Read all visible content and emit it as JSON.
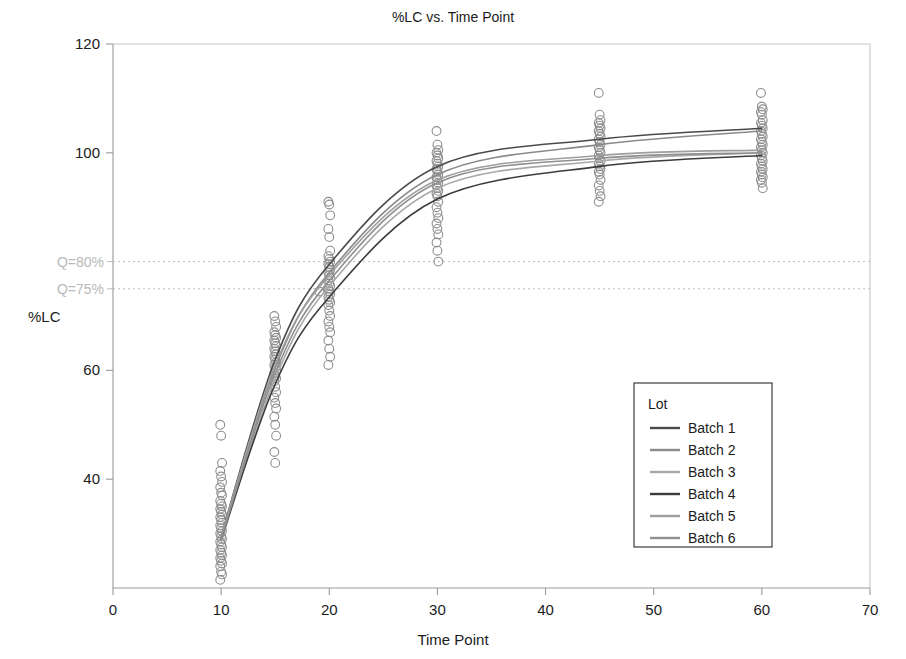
{
  "chart_data": {
    "type": "scatter",
    "title": "%LC vs. Time Point",
    "xlabel": "Time Point",
    "ylabel": "%LC",
    "xlim": [
      0,
      70
    ],
    "ylim": [
      20,
      120
    ],
    "grid": false,
    "xticks": [
      0,
      10,
      20,
      30,
      40,
      50,
      60,
      70
    ],
    "xtick_labels": [
      "0",
      "10",
      "20",
      "30",
      "40",
      "50",
      "60",
      "70"
    ],
    "yticks": [
      40,
      60,
      100,
      120
    ],
    "ytick_labels": [
      "40",
      "60",
      "100",
      "120"
    ],
    "legend": {
      "title": "Lot",
      "position": "right-lower",
      "entries": [
        {
          "label": "Batch 1",
          "color": "#4a4a4a"
        },
        {
          "label": "Batch 2",
          "color": "#8a8a8a"
        },
        {
          "label": "Batch 3",
          "color": "#a8a8a8"
        },
        {
          "label": "Batch 4",
          "color": "#3c3c3c"
        },
        {
          "label": "Batch 5",
          "color": "#9e9e9e"
        },
        {
          "label": "Batch 6",
          "color": "#8f8f8f"
        }
      ]
    },
    "reference_lines": [
      {
        "label": "Q=80%",
        "value": 80,
        "style": "dotted",
        "color": "#bdbdbd"
      },
      {
        "label": "Q=75%",
        "value": 75,
        "style": "dotted",
        "color": "#bdbdbd"
      }
    ],
    "x": [
      10,
      15,
      20,
      30,
      45,
      60
    ],
    "series": [
      {
        "name": "Batch 1",
        "color": "#4a4a4a",
        "curve_values": [
          29.5,
          62.0,
          79.5,
          97.5,
          102.5,
          104.5
        ]
      },
      {
        "name": "Batch 2",
        "color": "#8a8a8a",
        "curve_values": [
          29.0,
          60.5,
          78.0,
          96.0,
          101.5,
          104.0
        ]
      },
      {
        "name": "Batch 3",
        "color": "#a8a8a8",
        "curve_values": [
          28.5,
          58.5,
          75.5,
          93.5,
          98.5,
          100.0
        ]
      },
      {
        "name": "Batch 4",
        "color": "#3c3c3c",
        "curve_values": [
          29.0,
          57.5,
          73.5,
          91.5,
          97.5,
          99.5
        ]
      },
      {
        "name": "Batch 5",
        "color": "#9e9e9e",
        "curve_values": [
          29.5,
          61.0,
          77.5,
          95.0,
          99.5,
          100.5
        ]
      },
      {
        "name": "Batch 6",
        "color": "#8f8f8f",
        "curve_values": [
          29.0,
          59.5,
          76.5,
          94.5,
          99.0,
          100.0
        ]
      }
    ],
    "scatter_clusters": [
      {
        "x": 10,
        "marker": "open-circle",
        "color": "#8e8e8e",
        "n": 37,
        "range": [
          21.5,
          50.0
        ],
        "values": [
          50.0,
          48.0,
          43.0,
          41.5,
          40.5,
          39.5,
          38.5,
          37.5,
          37.0,
          36.0,
          35.5,
          35.0,
          34.5,
          34.0,
          33.5,
          33.0,
          32.5,
          32.0,
          31.5,
          31.0,
          30.5,
          30.0,
          29.5,
          29.0,
          28.5,
          28.0,
          27.5,
          27.0,
          26.5,
          26.0,
          25.5,
          25.0,
          24.5,
          24.0,
          23.0,
          22.5,
          21.5
        ]
      },
      {
        "x": 15,
        "marker": "open-circle",
        "color": "#8e8e8e",
        "n": 32,
        "range": [
          43.0,
          70.0
        ],
        "values": [
          70.0,
          69.0,
          68.0,
          67.0,
          66.5,
          66.0,
          65.5,
          65.0,
          64.5,
          64.0,
          63.5,
          63.0,
          62.5,
          62.0,
          61.5,
          61.0,
          60.5,
          60.0,
          59.5,
          59.0,
          58.5,
          58.0,
          57.0,
          56.0,
          55.0,
          54.0,
          53.0,
          51.5,
          50.0,
          48.0,
          45.0,
          43.0
        ]
      },
      {
        "x": 20,
        "marker": "open-circle",
        "color": "#8e8e8e",
        "n": 34,
        "range": [
          61.0,
          91.0
        ],
        "values": [
          91.0,
          90.5,
          88.5,
          86.0,
          84.5,
          82.0,
          81.0,
          80.5,
          80.0,
          79.5,
          79.0,
          78.5,
          78.0,
          77.5,
          77.0,
          76.5,
          76.0,
          75.5,
          75.0,
          74.5,
          74.0,
          73.5,
          73.0,
          72.5,
          72.0,
          71.0,
          70.0,
          69.0,
          68.0,
          67.0,
          65.5,
          64.0,
          62.5,
          61.0
        ]
      },
      {
        "x": 20,
        "marker": "open-circle",
        "color": "#8e8e8e",
        "n": 1,
        "range": [
          74.5,
          74.5
        ],
        "values": [
          74.5
        ],
        "note": "outlier left of main stack"
      },
      {
        "x": 30,
        "marker": "open-circle",
        "color": "#8e8e8e",
        "n": 30,
        "range": [
          80.0,
          104.0
        ],
        "values": [
          104.0,
          101.5,
          100.5,
          100.0,
          99.5,
          99.0,
          98.5,
          98.0,
          97.5,
          97.0,
          96.5,
          96.0,
          95.5,
          95.0,
          94.5,
          94.0,
          93.5,
          93.0,
          92.5,
          92.0,
          91.0,
          90.0,
          89.0,
          88.0,
          87.0,
          86.0,
          85.0,
          83.5,
          82.0,
          80.0
        ]
      },
      {
        "x": 45,
        "marker": "open-circle",
        "color": "#8e8e8e",
        "n": 28,
        "range": [
          91.0,
          111.0
        ],
        "values": [
          111.0,
          107.0,
          106.0,
          105.5,
          105.0,
          104.5,
          104.0,
          103.5,
          103.0,
          102.5,
          102.0,
          101.5,
          101.0,
          100.5,
          100.0,
          99.5,
          99.0,
          98.5,
          98.0,
          97.5,
          97.0,
          96.5,
          96.0,
          95.0,
          94.0,
          93.0,
          92.0,
          91.0
        ]
      },
      {
        "x": 60,
        "marker": "open-circle",
        "color": "#8e8e8e",
        "n": 30,
        "range": [
          93.5,
          111.0
        ],
        "values": [
          111.0,
          108.5,
          108.0,
          107.5,
          107.0,
          106.0,
          105.5,
          105.0,
          104.5,
          104.0,
          103.5,
          103.0,
          102.5,
          102.0,
          101.5,
          101.0,
          100.5,
          100.0,
          99.5,
          99.0,
          98.5,
          98.0,
          97.5,
          97.0,
          96.5,
          96.0,
          95.5,
          95.0,
          94.5,
          93.5
        ]
      }
    ]
  }
}
